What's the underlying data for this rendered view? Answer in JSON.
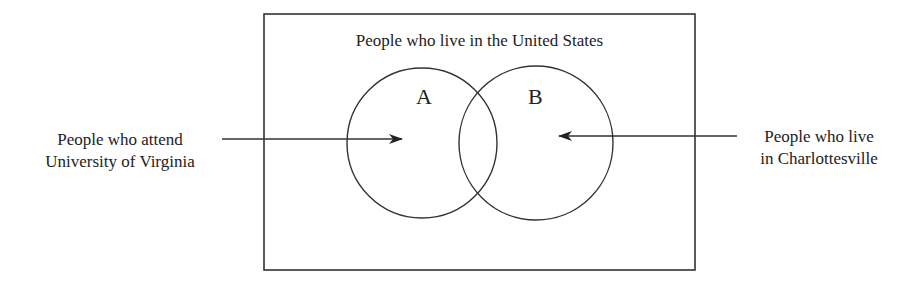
{
  "diagram": {
    "type": "venn",
    "universe": {
      "label": "People who live in the United States",
      "rect": {
        "x": 264,
        "y": 14,
        "width": 431,
        "height": 256
      }
    },
    "sets": [
      {
        "id": "A",
        "label": "A",
        "cx": 422,
        "cy": 143,
        "r": 75
      },
      {
        "id": "B",
        "label": "B",
        "cx": 536,
        "cy": 143,
        "r": 77
      }
    ],
    "annotations": [
      {
        "target": "A",
        "lines": [
          "People who attend",
          "University of Virginia"
        ],
        "arrow": {
          "x1": 222,
          "y1": 139,
          "x2": 402,
          "y2": 139
        }
      },
      {
        "target": "B",
        "lines": [
          "People who live",
          "in Charlottesville"
        ],
        "arrow": {
          "x1": 737,
          "y1": 136,
          "x2": 559,
          "y2": 136
        }
      }
    ],
    "colors": {
      "stroke": "#333333",
      "background": "#ffffff",
      "text": "#222222"
    }
  }
}
